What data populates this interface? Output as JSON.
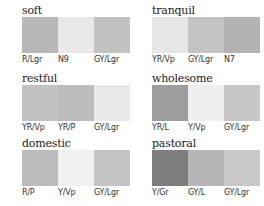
{
  "groups": [
    {
      "title": "soft",
      "swatches": [
        {
          "label": "R/Lgr",
          "color": "#b9b8b8"
        },
        {
          "label": "N9",
          "color": "#e9e9e9"
        },
        {
          "label": "GY/Lgr",
          "color": "#c2c2c2"
        }
      ]
    },
    {
      "title": "tranquil",
      "swatches": [
        {
          "label": "YR/Vp",
          "color": "#e6e6e6"
        },
        {
          "label": "GY/Lgr",
          "color": "#c4c4c4"
        },
        {
          "label": "N7",
          "color": "#b3b3b3"
        }
      ]
    },
    {
      "title": "restful",
      "swatches": [
        {
          "label": "YR/Vp",
          "color": "#c2c2c2"
        },
        {
          "label": "YR/P",
          "color": "#bdbdbd"
        },
        {
          "label": "GY/Lgr",
          "color": "#e9e9e9"
        }
      ]
    },
    {
      "title": "wholesome",
      "swatches": [
        {
          "label": "YR/L",
          "color": "#9d9d9d"
        },
        {
          "label": "Y/Vp",
          "color": "#efefef"
        },
        {
          "label": "GY/Lgr",
          "color": "#c6c6c6"
        }
      ]
    },
    {
      "title": "domestic",
      "swatches": [
        {
          "label": "R/P",
          "color": "#bbbbbb"
        },
        {
          "label": "Y/Vp",
          "color": "#f0f0f0"
        },
        {
          "label": "GY/Lgr",
          "color": "#c4c4c4"
        }
      ]
    },
    {
      "title": "pastoral",
      "swatches": [
        {
          "label": "Y/Gr",
          "color": "#7d7d7d"
        },
        {
          "label": "GY/L",
          "color": "#b5b5b5"
        },
        {
          "label": "GY/Lgr",
          "color": "#c9c9c9"
        }
      ]
    }
  ]
}
